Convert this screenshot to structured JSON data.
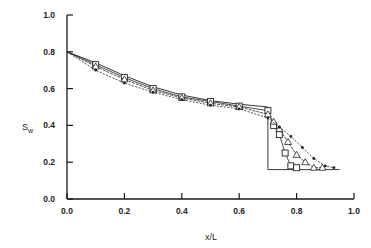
{
  "chart_data": {
    "type": "line",
    "title": "",
    "xlabel": "x/L",
    "ylabel": "S_w",
    "ylabel_main": "S",
    "ylabel_sub": "w",
    "xlim": [
      0.0,
      1.0
    ],
    "ylim": [
      0.0,
      1.0
    ],
    "xticks": [
      "0.0",
      "0.2",
      "0.4",
      "0.6",
      "0.8",
      "1.0"
    ],
    "yticks": [
      "0.0",
      "0.2",
      "0.4",
      "0.6",
      "0.8",
      "1.0"
    ],
    "grid": false,
    "legend": "none",
    "series": [
      {
        "name": "analytical step solution",
        "style": "thin line",
        "points": [
          [
            0.0,
            0.8
          ],
          [
            0.1,
            0.74
          ],
          [
            0.2,
            0.67
          ],
          [
            0.3,
            0.61
          ],
          [
            0.4,
            0.565
          ],
          [
            0.5,
            0.535
          ],
          [
            0.6,
            0.515
          ],
          [
            0.7,
            0.5
          ],
          [
            0.7,
            0.16
          ],
          [
            0.95,
            0.16
          ]
        ]
      },
      {
        "name": "series squares",
        "marker": "square",
        "points": [
          [
            0.0,
            0.8
          ],
          [
            0.1,
            0.73
          ],
          [
            0.2,
            0.66
          ],
          [
            0.3,
            0.6
          ],
          [
            0.4,
            0.555
          ],
          [
            0.5,
            0.53
          ],
          [
            0.6,
            0.505
          ],
          [
            0.7,
            0.48
          ],
          [
            0.72,
            0.4
          ],
          [
            0.74,
            0.35
          ],
          [
            0.76,
            0.25
          ],
          [
            0.78,
            0.18
          ],
          [
            0.8,
            0.17
          ]
        ]
      },
      {
        "name": "series triangles",
        "marker": "triangle",
        "points": [
          [
            0.0,
            0.8
          ],
          [
            0.1,
            0.72
          ],
          [
            0.2,
            0.65
          ],
          [
            0.3,
            0.59
          ],
          [
            0.4,
            0.55
          ],
          [
            0.5,
            0.52
          ],
          [
            0.6,
            0.5
          ],
          [
            0.7,
            0.46
          ],
          [
            0.72,
            0.42
          ],
          [
            0.74,
            0.38
          ],
          [
            0.77,
            0.31
          ],
          [
            0.8,
            0.24
          ],
          [
            0.83,
            0.2
          ],
          [
            0.86,
            0.17
          ],
          [
            0.89,
            0.17
          ]
        ]
      },
      {
        "name": "series dots",
        "marker": "dot",
        "points": [
          [
            0.0,
            0.8
          ],
          [
            0.1,
            0.7
          ],
          [
            0.2,
            0.63
          ],
          [
            0.3,
            0.58
          ],
          [
            0.4,
            0.54
          ],
          [
            0.5,
            0.51
          ],
          [
            0.6,
            0.49
          ],
          [
            0.7,
            0.44
          ],
          [
            0.74,
            0.39
          ],
          [
            0.78,
            0.34
          ],
          [
            0.82,
            0.28
          ],
          [
            0.86,
            0.22
          ],
          [
            0.9,
            0.18
          ],
          [
            0.93,
            0.17
          ]
        ]
      }
    ],
    "annotations": [],
    "colors": {
      "axis": "#1a1a1a",
      "lines": "#222222",
      "background": "#ffffff"
    }
  }
}
